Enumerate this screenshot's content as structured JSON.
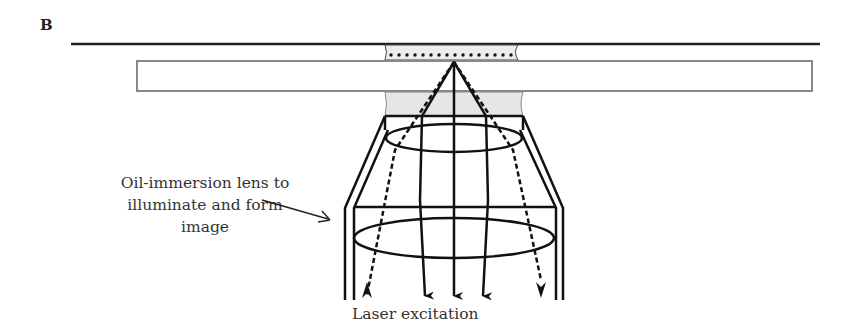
{
  "panel_label": "B",
  "labels": {
    "lens": [
      "Oil-immersion lens to",
      "illuminate and form image"
    ],
    "laser": "Laser excitation"
  },
  "components": {
    "top_boundary": "cover-slip surface",
    "sample_layer": "sample with fluorophores (dots)",
    "slide": "glass slide",
    "oil": "immersion oil",
    "objective": "objective lens with two internal lenses",
    "rays": {
      "emission_solid": 3,
      "excitation_dashed": 2
    }
  },
  "colors": {
    "ink": "#111111",
    "slide_border": "#888888",
    "oil_fill": "#e6e6e6"
  }
}
